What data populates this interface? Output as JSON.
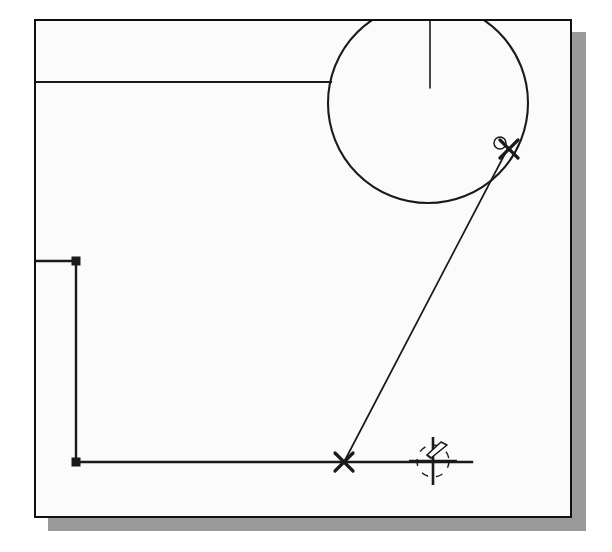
{
  "app": {
    "kind": "cad-drawing-canvas",
    "background_color": "#ffffff",
    "sheet_color": "#fbfbfb",
    "sheet_border_color": "#101010",
    "shadow_color": "#9a9a9a",
    "geometry_color": "#1a1a1a",
    "width": 612,
    "height": 552
  },
  "canvas": {
    "frame": {
      "x": 34,
      "y": 19,
      "width": 538,
      "height": 499,
      "border_width": 2
    },
    "shadow": {
      "offset_x": 14,
      "offset_y": 13
    }
  },
  "geometry": {
    "circle": {
      "name": "construction-circle",
      "cx": 428,
      "cy": 103,
      "r": 100,
      "stroke_width": 2.1,
      "clipped_by_frame_top": true
    },
    "center_line": {
      "name": "circle-center-line",
      "x1": 430,
      "y1": 21,
      "x2": 430,
      "y2": 88,
      "stroke_width": 1.6
    },
    "top_horizontal_line": {
      "name": "upper-horizontal-line",
      "x1": 36,
      "y1": 82,
      "x2": 331,
      "y2": 82,
      "stroke_width": 2.2
    },
    "left_vertical_line": {
      "name": "left-vertical-line",
      "x1": 76,
      "y1": 261,
      "x2": 76,
      "y2": 462,
      "stroke_width": 2.4
    },
    "left_stub_line": {
      "name": "left-stub-line",
      "x1": 36,
      "y1": 261,
      "x2": 76,
      "y2": 261,
      "stroke_width": 2.4
    },
    "bottom_horizontal_line": {
      "name": "bottom-horizontal-line",
      "x1": 76,
      "y1": 462,
      "x2": 472,
      "y2": 462,
      "stroke_width": 2.4
    },
    "diagonal_line": {
      "name": "diagonal-construction-line",
      "x1": 508,
      "y1": 148,
      "x2": 344,
      "y2": 462,
      "stroke_width": 1.7
    }
  },
  "grips": [
    {
      "name": "grip-upper-left",
      "x": 76,
      "y": 261,
      "size": 9
    },
    {
      "name": "grip-lower-left",
      "x": 76,
      "y": 462,
      "size": 9
    }
  ],
  "snap_markers": [
    {
      "name": "snap-marker-on-circle",
      "type": "x-cross",
      "x": 509,
      "y": 149,
      "arm": 9,
      "stroke_width": 3.2,
      "has_snap_ring": true,
      "ring_x": 500,
      "ring_y": 143,
      "ring_r": 6
    },
    {
      "name": "snap-marker-on-baseline",
      "type": "x-cross",
      "x": 344,
      "y": 462,
      "arm": 9,
      "stroke_width": 3.2,
      "has_snap_ring": false
    }
  ],
  "cursor": {
    "name": "crosshair-pick-cursor",
    "cx": 433,
    "cy": 461,
    "crosshair_half_length": 24,
    "crosshair_stroke_width": 2.6,
    "aperture_radius": 16,
    "aperture_dash": "7 8",
    "aperture_stroke_width": 1.4,
    "badge": {
      "name": "pencil-badge-icon",
      "x": 425,
      "y": 440,
      "width": 22,
      "height": 18
    }
  },
  "labels": {
    "canvas_title": "",
    "status": ""
  }
}
